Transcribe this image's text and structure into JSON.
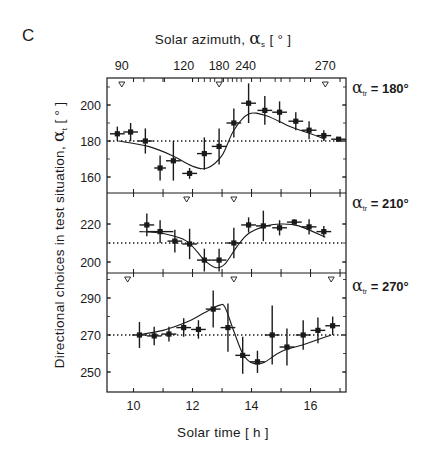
{
  "figure": {
    "panel_letter": "C",
    "top_axis_title": "Solar azimuth,  αs  [ ° ]",
    "top_axis_title_parts": {
      "prefix": "Solar azimuth,  ",
      "symbol": "α",
      "sub": "s",
      "suffix": "  [ ° ]"
    },
    "x_axis_title": "Solar time   [ h ]",
    "y_axis_title": "Directional choices in test situation,  αt  [ ° ]",
    "y_axis_title_parts": {
      "prefix": "Directional choices in test situation,  ",
      "symbol": "α",
      "sub": "t",
      "suffix": "  [ ° ]"
    },
    "panel_labels": [
      {
        "symbol": "α",
        "sub": "tr",
        "text": " = 180°"
      },
      {
        "symbol": "α",
        "sub": "tr",
        "text": " = 210°"
      },
      {
        "symbol": "α",
        "sub": "tr",
        "text": " = 270°"
      }
    ]
  },
  "chart_data": [
    {
      "type": "scatter",
      "title": "αtr = 180°",
      "xlabel": "Solar time [h]",
      "ylabel": "Directional choices in test situation, αt [°]",
      "xlim": [
        9.1,
        17.2
      ],
      "ylim": [
        150,
        214
      ],
      "x_ticks": [
        10,
        12,
        14,
        16
      ],
      "y_ticks": [
        160,
        180,
        200
      ],
      "reference_line": 180,
      "top_axis": {
        "label": "Solar azimuth, αs [°]",
        "tick_labels": [
          "90",
          "120",
          "180",
          "240",
          "270"
        ],
        "tick_positions_h": [
          9.6,
          11.7,
          12.9,
          13.8,
          16.5
        ]
      },
      "markers_triangle_h": [
        9.6,
        12.9,
        16.5
      ],
      "points": [
        {
          "x": 9.45,
          "y": 184,
          "yerr": 4,
          "xerr": 0.25
        },
        {
          "x": 9.9,
          "y": 185,
          "yerr": 5,
          "xerr": 0.25
        },
        {
          "x": 10.4,
          "y": 180,
          "yerr": 7,
          "xerr": 0.25
        },
        {
          "x": 10.9,
          "y": 165,
          "yerr": 7,
          "xerr": 0.2
        },
        {
          "x": 11.35,
          "y": 169,
          "yerr": 11,
          "xerr": 0.25
        },
        {
          "x": 11.9,
          "y": 162,
          "yerr": 3,
          "xerr": 0.25
        },
        {
          "x": 12.4,
          "y": 173,
          "yerr": 9,
          "xerr": 0.25
        },
        {
          "x": 12.9,
          "y": 177,
          "yerr": 10,
          "xerr": 0.25
        },
        {
          "x": 13.4,
          "y": 190,
          "yerr": 8,
          "xerr": 0.25
        },
        {
          "x": 13.9,
          "y": 201,
          "yerr": 11,
          "xerr": 0.25
        },
        {
          "x": 14.45,
          "y": 197,
          "yerr": 8,
          "xerr": 0.25
        },
        {
          "x": 14.95,
          "y": 196,
          "yerr": 6,
          "xerr": 0.25
        },
        {
          "x": 15.5,
          "y": 191,
          "yerr": 5,
          "xerr": 0.25
        },
        {
          "x": 15.95,
          "y": 186,
          "yerr": 5,
          "xerr": 0.25
        },
        {
          "x": 16.45,
          "y": 183,
          "yerr": 3,
          "xerr": 0.25
        },
        {
          "x": 16.95,
          "y": 181,
          "yerr": 1,
          "xerr": 0.25
        }
      ],
      "model_curve": [
        [
          9.5,
          180
        ],
        [
          10.5,
          177
        ],
        [
          11.3,
          172
        ],
        [
          12.0,
          166
        ],
        [
          12.5,
          165
        ],
        [
          13.0,
          172
        ],
        [
          13.4,
          186
        ],
        [
          13.9,
          195
        ],
        [
          14.5,
          194
        ],
        [
          15.3,
          188
        ],
        [
          16.0,
          184
        ],
        [
          16.5,
          181
        ]
      ]
    },
    {
      "type": "scatter",
      "title": "αtr = 210°",
      "xlim": [
        9.1,
        17.2
      ],
      "ylim": [
        193,
        229
      ],
      "y_ticks": [
        200,
        220
      ],
      "reference_line": 210,
      "markers_triangle_h": [
        11.8,
        13.4
      ],
      "points": [
        {
          "x": 10.45,
          "y": 219.5,
          "yerr": 6,
          "xerr": 0.25
        },
        {
          "x": 10.9,
          "y": 216,
          "yerr": 6,
          "xerr": 0.45
        },
        {
          "x": 11.4,
          "y": 211,
          "yerr": 6,
          "xerr": 0.25
        },
        {
          "x": 11.9,
          "y": 209.5,
          "yerr": 8,
          "xerr": 0.25
        },
        {
          "x": 12.4,
          "y": 201,
          "yerr": 6,
          "xerr": 0.25
        },
        {
          "x": 12.9,
          "y": 201,
          "yerr": 6,
          "xerr": 0.25
        },
        {
          "x": 13.4,
          "y": 210,
          "yerr": 8,
          "xerr": 0.25
        },
        {
          "x": 13.9,
          "y": 219.5,
          "yerr": 4,
          "xerr": 0.25
        },
        {
          "x": 14.4,
          "y": 219,
          "yerr": 8,
          "xerr": 0.25
        },
        {
          "x": 14.95,
          "y": 218,
          "yerr": 4,
          "xerr": 0.25
        },
        {
          "x": 15.45,
          "y": 221,
          "yerr": 1.5,
          "xerr": 0.25
        },
        {
          "x": 15.95,
          "y": 218.5,
          "yerr": 4,
          "xerr": 0.25
        },
        {
          "x": 16.45,
          "y": 216,
          "yerr": 3,
          "xerr": 0.25
        }
      ],
      "model_curve": [
        [
          10.2,
          216
        ],
        [
          11.0,
          215
        ],
        [
          11.8,
          211
        ],
        [
          12.4,
          201
        ],
        [
          12.8,
          197
        ],
        [
          13.1,
          199
        ],
        [
          13.5,
          208
        ],
        [
          13.9,
          215
        ],
        [
          14.5,
          219
        ],
        [
          15.0,
          220
        ],
        [
          15.6,
          219
        ],
        [
          16.5,
          213
        ]
      ]
    },
    {
      "type": "scatter",
      "title": "αtr = 270°",
      "xlim": [
        9.1,
        17.2
      ],
      "ylim": [
        241,
        302
      ],
      "y_ticks": [
        250,
        270,
        290
      ],
      "reference_line": 270,
      "markers_triangle_h": [
        9.8,
        13.4,
        16.7
      ],
      "points": [
        {
          "x": 10.2,
          "y": 270,
          "yerr": 7,
          "xerr": 0.25
        },
        {
          "x": 10.7,
          "y": 269.5,
          "yerr": 5,
          "xerr": 0.25
        },
        {
          "x": 11.2,
          "y": 270.5,
          "yerr": 4,
          "xerr": 0.25
        },
        {
          "x": 11.7,
          "y": 274,
          "yerr": 5,
          "xerr": 0.25
        },
        {
          "x": 12.2,
          "y": 273,
          "yerr": 5,
          "xerr": 0.25
        },
        {
          "x": 12.7,
          "y": 284,
          "yerr": 10,
          "xerr": 0.25
        },
        {
          "x": 13.2,
          "y": 274,
          "yerr": 13,
          "xerr": 0.25
        },
        {
          "x": 13.7,
          "y": 259,
          "yerr": 10,
          "xerr": 0.25
        },
        {
          "x": 14.2,
          "y": 255.5,
          "yerr": 6,
          "xerr": 0.25
        },
        {
          "x": 14.7,
          "y": 270,
          "yerr": 16,
          "xerr": 0.25
        },
        {
          "x": 15.2,
          "y": 263.5,
          "yerr": 10,
          "xerr": 0.25
        },
        {
          "x": 15.75,
          "y": 270,
          "yerr": 8,
          "xerr": 0.25
        },
        {
          "x": 16.25,
          "y": 272.5,
          "yerr": 7,
          "xerr": 0.25
        },
        {
          "x": 16.75,
          "y": 275,
          "yerr": 5,
          "xerr": 0.25
        }
      ],
      "model_curve": [
        [
          10.1,
          270
        ],
        [
          11.0,
          272.5
        ],
        [
          11.8,
          277
        ],
        [
          12.4,
          282
        ],
        [
          12.9,
          286
        ],
        [
          13.1,
          285
        ],
        [
          13.4,
          272
        ],
        [
          13.7,
          260
        ],
        [
          14.0,
          255
        ],
        [
          14.4,
          255
        ],
        [
          15.0,
          261
        ],
        [
          15.8,
          265
        ],
        [
          16.7,
          270
        ]
      ]
    }
  ]
}
